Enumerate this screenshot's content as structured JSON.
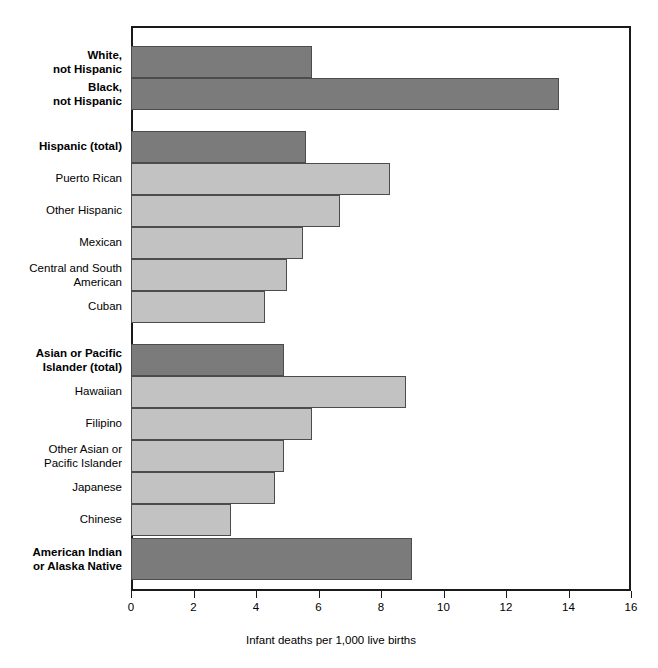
{
  "chart_data": {
    "type": "bar",
    "orientation": "horizontal",
    "title": "",
    "xlabel": "Infant deaths per 1,000 live births",
    "ylabel": "",
    "xlim": [
      0,
      16
    ],
    "xticks": [
      0,
      2,
      4,
      6,
      8,
      10,
      12,
      14,
      16
    ],
    "xtick_labels": [
      "0",
      "2",
      "4",
      "6",
      "8",
      "10",
      "12",
      "14",
      "16"
    ],
    "grid": false,
    "legend": "none",
    "categories": [
      "White, not Hispanic",
      "Black, not Hispanic",
      "Hispanic (total)",
      "Puerto Rican",
      "Other Hispanic",
      "Mexican",
      "Central and South American",
      "Cuban",
      "Asian or Pacific Islander (total)",
      "Hawaiian",
      "Filipino",
      "Other Asian or Pacific Islander",
      "Japanese",
      "Chinese",
      "American Indian or Alaska Native"
    ],
    "values": [
      5.8,
      13.7,
      5.6,
      8.3,
      6.7,
      5.5,
      5.0,
      4.3,
      4.9,
      8.8,
      5.8,
      4.9,
      4.6,
      3.2,
      9.0
    ],
    "colors": {
      "total_bar": "#7b7b7b",
      "subgroup_bar": "#c2c2c2",
      "bar_border": "#4c4c4c",
      "axis": "#1a1a1a"
    }
  },
  "bars": [
    {
      "label": "White,\nnot Hispanic",
      "value": 5.8,
      "style": "dark",
      "bold": true,
      "top": 20,
      "height": 32,
      "label_top": 23
    },
    {
      "label": "Black,\nnot Hispanic",
      "value": 13.7,
      "style": "dark",
      "bold": true,
      "top": 52,
      "height": 32,
      "label_top": 55
    },
    {
      "label": "Hispanic (total)",
      "value": 5.6,
      "style": "dark",
      "bold": true,
      "top": 105,
      "height": 32,
      "label_top": 114
    },
    {
      "label": "Puerto Rican",
      "value": 8.3,
      "style": "light",
      "bold": false,
      "top": 137,
      "height": 32,
      "label_top": 146
    },
    {
      "label": "Other Hispanic",
      "value": 6.7,
      "style": "light",
      "bold": false,
      "top": 169,
      "height": 32,
      "label_top": 178
    },
    {
      "label": "Mexican",
      "value": 5.5,
      "style": "light",
      "bold": false,
      "top": 201,
      "height": 32,
      "label_top": 210
    },
    {
      "label": "Central and South\nAmerican",
      "value": 5.0,
      "style": "light",
      "bold": false,
      "top": 233,
      "height": 32,
      "label_top": 236
    },
    {
      "label": "Cuban",
      "value": 4.3,
      "style": "light",
      "bold": false,
      "top": 265,
      "height": 32,
      "label_top": 274
    },
    {
      "label": "Asian or Pacific\nIslander (total)",
      "value": 4.9,
      "style": "dark",
      "bold": true,
      "top": 318,
      "height": 32,
      "label_top": 321
    },
    {
      "label": "Hawaiian",
      "value": 8.8,
      "style": "light",
      "bold": false,
      "top": 350,
      "height": 32,
      "label_top": 359
    },
    {
      "label": "Filipino",
      "value": 5.8,
      "style": "light",
      "bold": false,
      "top": 382,
      "height": 32,
      "label_top": 391
    },
    {
      "label": "Other Asian or\nPacific Islander",
      "value": 4.9,
      "style": "light",
      "bold": false,
      "top": 414,
      "height": 32,
      "label_top": 417
    },
    {
      "label": "Japanese",
      "value": 4.6,
      "style": "light",
      "bold": false,
      "top": 446,
      "height": 32,
      "label_top": 455
    },
    {
      "label": "Chinese",
      "value": 3.2,
      "style": "light",
      "bold": false,
      "top": 478,
      "height": 32,
      "label_top": 487
    },
    {
      "label": "American Indian\nor Alaska Native",
      "value": 9.0,
      "style": "dark",
      "bold": true,
      "top": 512,
      "height": 42,
      "label_top": 520
    }
  ],
  "axis": {
    "title": "Infant deaths per 1,000 live births",
    "ticks": [
      "0",
      "2",
      "4",
      "6",
      "8",
      "10",
      "12",
      "14",
      "16"
    ]
  }
}
